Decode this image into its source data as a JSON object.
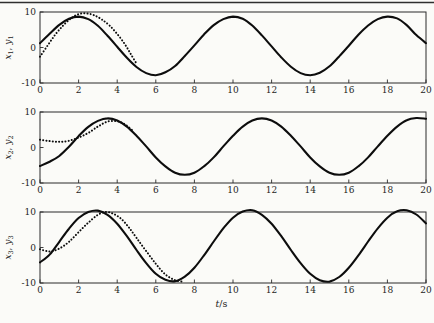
{
  "figure": {
    "xlabel": {
      "var": "t",
      "unit": "/s"
    },
    "colors": {
      "curve": "#0d0d0d",
      "axis": "#2b2b2b",
      "text": "#1e1e1e",
      "rule": "#2f2f2f",
      "background": "#fbfbf8"
    }
  },
  "chart_data": [
    {
      "type": "line",
      "title": "",
      "ylabel": {
        "v1": "x",
        "s1": "1",
        "sep": ", ",
        "v2": "y",
        "s2": "1"
      },
      "xlim": [
        0,
        20
      ],
      "ylim": [
        -10,
        10
      ],
      "grid": false,
      "legend": "none",
      "xticks": [
        0,
        2,
        4,
        6,
        8,
        10,
        12,
        14,
        16,
        18,
        20
      ],
      "xtick_labels": [
        "0",
        "2",
        "4",
        "6",
        "8",
        "10",
        "12",
        "14",
        "16",
        "18",
        "20"
      ],
      "yticks": [
        10,
        0,
        -10
      ],
      "ytick_labels": [
        "10",
        "0",
        "-10"
      ],
      "series": [
        {
          "id": "solid-curve-1",
          "style": "solid",
          "points": [
            [
              0,
              1.2
            ],
            [
              0.5,
              3.9
            ],
            [
              1,
              6.4
            ],
            [
              1.5,
              8.1
            ],
            [
              2,
              8.7
            ],
            [
              2.5,
              8.0
            ],
            [
              3,
              6.1
            ],
            [
              3.5,
              3.3
            ],
            [
              4,
              0.2
            ],
            [
              4.5,
              -2.9
            ],
            [
              5,
              -5.5
            ],
            [
              5.5,
              -7.2
            ],
            [
              6,
              -7.8
            ],
            [
              6.5,
              -7.0
            ],
            [
              7,
              -5.2
            ],
            [
              7.5,
              -2.4
            ],
            [
              8,
              0.6
            ],
            [
              8.5,
              3.7
            ],
            [
              9,
              6.3
            ],
            [
              9.5,
              8.0
            ],
            [
              10,
              8.7
            ],
            [
              10.5,
              8.1
            ],
            [
              11,
              6.2
            ],
            [
              11.5,
              3.4
            ],
            [
              12,
              0.3
            ],
            [
              12.5,
              -2.8
            ],
            [
              13,
              -5.4
            ],
            [
              13.5,
              -7.2
            ],
            [
              14,
              -7.8
            ],
            [
              14.5,
              -7.1
            ],
            [
              15,
              -5.3
            ],
            [
              15.5,
              -2.5
            ],
            [
              16,
              0.5
            ],
            [
              16.5,
              3.6
            ],
            [
              17,
              6.2
            ],
            [
              17.5,
              8.0
            ],
            [
              18,
              8.7
            ],
            [
              18.5,
              8.2
            ],
            [
              19,
              6.3
            ],
            [
              19.5,
              3.5
            ],
            [
              20,
              1.2
            ]
          ]
        },
        {
          "id": "dotted-curve-1",
          "style": "dotted",
          "points": [
            [
              0,
              -2.6
            ],
            [
              0.4,
              0.6
            ],
            [
              0.8,
              3.7
            ],
            [
              1.2,
              6.2
            ],
            [
              1.6,
              8.2
            ],
            [
              2,
              9.4
            ],
            [
              2.4,
              9.6
            ],
            [
              2.8,
              9.1
            ],
            [
              3.2,
              7.9
            ],
            [
              3.6,
              6.2
            ],
            [
              4,
              3.8
            ],
            [
              4.4,
              0.9
            ],
            [
              4.7,
              -1.8
            ],
            [
              5,
              -4.5
            ]
          ]
        }
      ]
    },
    {
      "type": "line",
      "title": "",
      "ylabel": {
        "v1": "x",
        "s1": "2",
        "sep": ", ",
        "v2": "y",
        "s2": "2"
      },
      "xlim": [
        0,
        20
      ],
      "ylim": [
        -10,
        10
      ],
      "grid": false,
      "legend": "none",
      "xticks": [
        0,
        2,
        4,
        6,
        8,
        10,
        12,
        14,
        16,
        18,
        20
      ],
      "xtick_labels": [
        "0",
        "2",
        "4",
        "6",
        "8",
        "10",
        "12",
        "14",
        "16",
        "18",
        "20"
      ],
      "yticks": [
        10,
        0,
        -10
      ],
      "ytick_labels": [
        "10",
        "0",
        "-10"
      ],
      "series": [
        {
          "id": "solid-curve-2",
          "style": "solid",
          "points": [
            [
              0,
              -5.2
            ],
            [
              0.5,
              -4.0
            ],
            [
              1,
              -2.4
            ],
            [
              1.5,
              0.2
            ],
            [
              2,
              3.2
            ],
            [
              2.5,
              5.8
            ],
            [
              3,
              7.5
            ],
            [
              3.5,
              8.2
            ],
            [
              4,
              7.6
            ],
            [
              4.5,
              5.9
            ],
            [
              5,
              3.3
            ],
            [
              5.5,
              0.3
            ],
            [
              6,
              -2.8
            ],
            [
              6.5,
              -5.3
            ],
            [
              7,
              -7.1
            ],
            [
              7.5,
              -7.7
            ],
            [
              8,
              -7.1
            ],
            [
              8.5,
              -5.3
            ],
            [
              9,
              -2.8
            ],
            [
              9.5,
              0.3
            ],
            [
              10,
              3.3
            ],
            [
              10.5,
              5.9
            ],
            [
              11,
              7.6
            ],
            [
              11.5,
              8.2
            ],
            [
              12,
              7.6
            ],
            [
              12.5,
              5.9
            ],
            [
              13,
              3.3
            ],
            [
              13.5,
              0.3
            ],
            [
              14,
              -2.8
            ],
            [
              14.5,
              -5.3
            ],
            [
              15,
              -7.1
            ],
            [
              15.5,
              -7.7
            ],
            [
              16,
              -7.1
            ],
            [
              16.5,
              -5.3
            ],
            [
              17,
              -2.8
            ],
            [
              17.5,
              0.3
            ],
            [
              18,
              3.3
            ],
            [
              18.5,
              5.9
            ],
            [
              19,
              7.7
            ],
            [
              19.5,
              8.3
            ],
            [
              20,
              8.1
            ]
          ]
        },
        {
          "id": "dotted-curve-2",
          "style": "dotted",
          "points": [
            [
              0,
              2.2
            ],
            [
              0.5,
              1.8
            ],
            [
              1,
              1.6
            ],
            [
              1.5,
              1.9
            ],
            [
              2,
              2.8
            ],
            [
              2.5,
              4.1
            ],
            [
              3,
              5.9
            ],
            [
              3.5,
              7.3
            ],
            [
              4,
              7.4
            ],
            [
              4.4,
              6.5
            ],
            [
              4.8,
              4.8
            ]
          ]
        }
      ]
    },
    {
      "type": "line",
      "title": "",
      "ylabel": {
        "v1": "x",
        "s1": "3",
        "sep": ", ",
        "v2": "y",
        "s2": "3"
      },
      "xlabel": {
        "var": "t",
        "unit": "/s"
      },
      "xlim": [
        0,
        20
      ],
      "ylim": [
        -10,
        10
      ],
      "grid": false,
      "legend": "none",
      "xticks": [
        0,
        2,
        4,
        6,
        8,
        10,
        12,
        14,
        16,
        18,
        20
      ],
      "xtick_labels": [
        "0",
        "2",
        "4",
        "6",
        "8",
        "10",
        "12",
        "14",
        "16",
        "18",
        "20"
      ],
      "yticks": [
        10,
        0,
        -10
      ],
      "ytick_labels": [
        "10",
        "0",
        "-10"
      ],
      "series": [
        {
          "id": "solid-curve-3",
          "style": "solid",
          "points": [
            [
              0,
              -4.2
            ],
            [
              0.5,
              -2.0
            ],
            [
              1,
              1.6
            ],
            [
              1.5,
              5.3
            ],
            [
              2,
              8.3
            ],
            [
              2.5,
              10.0
            ],
            [
              3,
              10.4
            ],
            [
              3.5,
              9.2
            ],
            [
              4,
              6.7
            ],
            [
              4.5,
              3.2
            ],
            [
              5,
              -0.7
            ],
            [
              5.5,
              -4.4
            ],
            [
              6,
              -7.4
            ],
            [
              6.5,
              -9.1
            ],
            [
              7,
              -9.5
            ],
            [
              7.5,
              -8.2
            ],
            [
              8,
              -5.7
            ],
            [
              8.5,
              -2.2
            ],
            [
              9,
              1.7
            ],
            [
              9.5,
              5.4
            ],
            [
              10,
              8.4
            ],
            [
              10.5,
              10.1
            ],
            [
              11,
              10.5
            ],
            [
              11.5,
              9.2
            ],
            [
              12,
              6.7
            ],
            [
              12.5,
              3.2
            ],
            [
              13,
              -0.7
            ],
            [
              13.5,
              -4.4
            ],
            [
              14,
              -7.4
            ],
            [
              14.5,
              -9.2
            ],
            [
              15,
              -9.6
            ],
            [
              15.5,
              -8.3
            ],
            [
              16,
              -5.7
            ],
            [
              16.5,
              -2.2
            ],
            [
              17,
              1.7
            ],
            [
              17.5,
              5.4
            ],
            [
              18,
              8.4
            ],
            [
              18.5,
              10.2
            ],
            [
              19,
              10.5
            ],
            [
              19.5,
              9.3
            ],
            [
              20,
              6.8
            ]
          ]
        },
        {
          "id": "dotted-curve-3",
          "style": "dotted",
          "points": [
            [
              0,
              -0.5
            ],
            [
              0.5,
              -1.1
            ],
            [
              1,
              -0.3
            ],
            [
              1.5,
              1.6
            ],
            [
              2,
              4.3
            ],
            [
              2.5,
              7.0
            ],
            [
              3,
              9.2
            ],
            [
              3.4,
              10.0
            ],
            [
              3.8,
              9.5
            ],
            [
              4.2,
              8.1
            ],
            [
              4.6,
              5.7
            ],
            [
              5,
              2.7
            ],
            [
              5.5,
              -1.0
            ],
            [
              6,
              -4.6
            ],
            [
              6.5,
              -7.6
            ],
            [
              7,
              -9.2
            ],
            [
              7.4,
              -9.6
            ]
          ]
        }
      ]
    }
  ]
}
